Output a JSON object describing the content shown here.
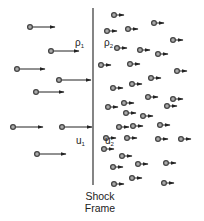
{
  "diagram": {
    "title": "Shock Frame",
    "caption_line1": "Shock",
    "caption_line2": "Frame",
    "colors": {
      "line": "#333333",
      "particle_stroke": "#444444",
      "particle_fill": "#aaaaaa",
      "background": "#ffffff"
    },
    "shock_line": {
      "x": 93,
      "y1": 8,
      "y2": 185
    },
    "labels": {
      "rho1": {
        "symbol": "ρ",
        "sub": "1",
        "x": 75,
        "y": 38
      },
      "rho2": {
        "symbol": "ρ",
        "sub": "2",
        "x": 104,
        "y": 38
      },
      "u1": {
        "symbol": "u",
        "sub": "1",
        "x": 76,
        "y": 136
      },
      "u2": {
        "symbol": "u",
        "sub": "2",
        "x": 105,
        "y": 136
      }
    },
    "upstream_particles": [
      {
        "x": 30,
        "y": 27,
        "len": 25
      },
      {
        "x": 51,
        "y": 51,
        "len": 28
      },
      {
        "x": 17,
        "y": 69,
        "len": 28
      },
      {
        "x": 59,
        "y": 80,
        "len": 32
      },
      {
        "x": 36,
        "y": 92,
        "len": 28
      },
      {
        "x": 13,
        "y": 127,
        "len": 30
      },
      {
        "x": 62,
        "y": 127,
        "len": 30
      },
      {
        "x": 37,
        "y": 154,
        "len": 29
      }
    ],
    "downstream_particles": [
      {
        "x": 114,
        "y": 15
      },
      {
        "x": 107,
        "y": 31
      },
      {
        "x": 128,
        "y": 29
      },
      {
        "x": 154,
        "y": 23
      },
      {
        "x": 117,
        "y": 48
      },
      {
        "x": 140,
        "y": 50
      },
      {
        "x": 158,
        "y": 54
      },
      {
        "x": 173,
        "y": 40
      },
      {
        "x": 101,
        "y": 65
      },
      {
        "x": 130,
        "y": 64
      },
      {
        "x": 177,
        "y": 71
      },
      {
        "x": 151,
        "y": 78
      },
      {
        "x": 132,
        "y": 84
      },
      {
        "x": 113,
        "y": 88
      },
      {
        "x": 148,
        "y": 97
      },
      {
        "x": 173,
        "y": 99
      },
      {
        "x": 124,
        "y": 103
      },
      {
        "x": 167,
        "y": 106
      },
      {
        "x": 108,
        "y": 107
      },
      {
        "x": 126,
        "y": 113
      },
      {
        "x": 143,
        "y": 116
      },
      {
        "x": 133,
        "y": 126
      },
      {
        "x": 119,
        "y": 127
      },
      {
        "x": 160,
        "y": 125
      },
      {
        "x": 106,
        "y": 138
      },
      {
        "x": 127,
        "y": 138
      },
      {
        "x": 158,
        "y": 139
      },
      {
        "x": 181,
        "y": 139
      },
      {
        "x": 104,
        "y": 149
      },
      {
        "x": 122,
        "y": 156
      },
      {
        "x": 113,
        "y": 167
      },
      {
        "x": 138,
        "y": 164
      },
      {
        "x": 166,
        "y": 163
      },
      {
        "x": 132,
        "y": 178
      },
      {
        "x": 114,
        "y": 184
      },
      {
        "x": 164,
        "y": 183
      }
    ],
    "downstream_arrow_length": 10
  }
}
